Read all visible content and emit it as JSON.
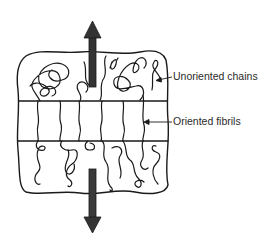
{
  "diagram": {
    "type": "polymer-necking-schematic",
    "labels": {
      "unoriented": "Unoriented chains",
      "oriented": "Oriented fibrils"
    },
    "regions": [
      {
        "name": "top-region",
        "content": "unoriented chains"
      },
      {
        "name": "middle-band",
        "content": "oriented fibrils"
      },
      {
        "name": "bottom-region",
        "content": "unoriented chains"
      }
    ],
    "arrows": [
      {
        "name": "tensile-arrow-up",
        "direction": "up"
      },
      {
        "name": "tensile-arrow-down",
        "direction": "down"
      }
    ],
    "colors": {
      "stroke": "#1a1a1a",
      "arrow_fill": "#333333",
      "background": "#ffffff"
    }
  }
}
